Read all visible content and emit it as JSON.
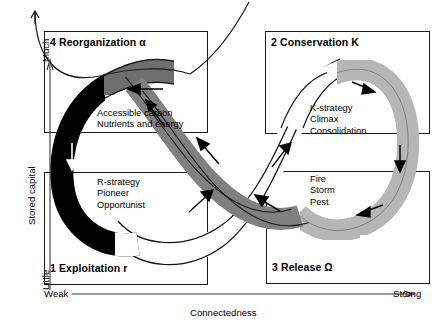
{
  "figure": {
    "type": "adaptive-cycle-diagram",
    "axes": {
      "y": {
        "title": "Stored capital",
        "low": "Little",
        "high": "Much"
      },
      "x": {
        "title": "Connectedness",
        "low": "Weak",
        "high": "Strong"
      }
    },
    "quadrants": [
      {
        "id": "exploitation",
        "number": "1",
        "name": "Exploitation",
        "greek": "r",
        "label": "1 Exploitation r",
        "notes": [
          "R-strategy",
          "Pioneer",
          "Opportunist"
        ],
        "position": "bottom-left"
      },
      {
        "id": "conservation",
        "number": "2",
        "name": "Conservation",
        "greek": "K",
        "label": "2 Conservation K",
        "notes": [
          "K-strategy",
          "Climax",
          "Consolidation"
        ],
        "position": "top-right"
      },
      {
        "id": "release",
        "number": "3",
        "name": "Release",
        "greek": "Ω",
        "label": "3 Release Ω",
        "notes": [
          "Fire",
          "Storm",
          "Pest"
        ],
        "position": "bottom-right"
      },
      {
        "id": "reorganization",
        "number": "4",
        "name": "Reorganization",
        "greek": "α",
        "label": "4 Reorganization α",
        "notes": [
          "Accessible carbon",
          "Nutrients and energy"
        ],
        "position": "top-left"
      }
    ],
    "band_colors": {
      "black": "#000000",
      "dark_gray": "#6e6e6e",
      "mid_gray": "#808080",
      "light_gray": "#b6b6b6",
      "white": "#ffffff",
      "outline": "#111111"
    },
    "flow_arrows": 9
  }
}
